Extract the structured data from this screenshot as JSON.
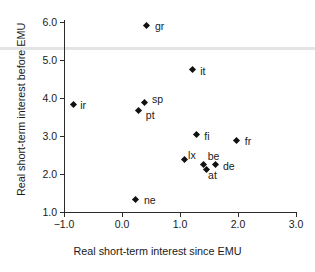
{
  "chart_data": {
    "type": "scatter",
    "title": "",
    "xlabel": "Real short-term interest since EMU",
    "ylabel": "Real short-term interest before EMU",
    "xlim": [
      -1.0,
      3.0
    ],
    "ylim": [
      1.0,
      6.0
    ],
    "xticks": [
      "-1.0",
      "0.0",
      "1.0",
      "2.0",
      "3.0"
    ],
    "xtick_values": [
      -1.0,
      0.0,
      1.0,
      2.0,
      3.0
    ],
    "yticks": [
      "1.0",
      "2.0",
      "3.0",
      "4.0",
      "5.0",
      "6.0"
    ],
    "ytick_values": [
      1.0,
      2.0,
      3.0,
      4.0,
      5.0,
      6.0
    ],
    "grid": false,
    "legend": "none",
    "points": [
      {
        "label": "gr",
        "x": 0.43,
        "y": 5.92,
        "label_dx": 8,
        "label_dy": -4
      },
      {
        "label": "it",
        "x": 1.21,
        "y": 4.74,
        "label_dx": 8,
        "label_dy": -4
      },
      {
        "label": "ir",
        "x": -0.84,
        "y": 3.84,
        "label_dx": 7,
        "label_dy": -4
      },
      {
        "label": "sp",
        "x": 0.38,
        "y": 3.87,
        "label_dx": 8,
        "label_dy": -9
      },
      {
        "label": "pt",
        "x": 0.29,
        "y": 3.68,
        "label_dx": 7,
        "label_dy": 0
      },
      {
        "label": "fi",
        "x": 1.28,
        "y": 3.03,
        "label_dx": 8,
        "label_dy": -4
      },
      {
        "label": "fr",
        "x": 1.98,
        "y": 2.89,
        "label_dx": 8,
        "label_dy": -4
      },
      {
        "label": "lx",
        "x": 1.07,
        "y": 2.37,
        "label_dx": 4,
        "label_dy": -10
      },
      {
        "label": "be",
        "x": 1.41,
        "y": 2.26,
        "label_dx": 4,
        "label_dy": -13
      },
      {
        "label": "at",
        "x": 1.45,
        "y": 2.13,
        "label_dx": 2,
        "label_dy": 1
      },
      {
        "label": "de",
        "x": 1.62,
        "y": 2.24,
        "label_dx": 7,
        "label_dy": -4
      },
      {
        "label": "ne",
        "x": 0.24,
        "y": 1.34,
        "label_dx": 8,
        "label_dy": -4
      }
    ]
  }
}
